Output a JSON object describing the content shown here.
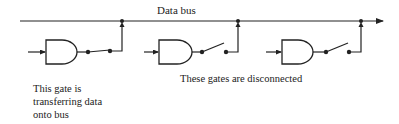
{
  "diagram": {
    "bus": {
      "label": "Data bus",
      "y": 21,
      "x_start": 20,
      "x_end": 385,
      "color": "#222222"
    },
    "gates": [
      {
        "id": "gate-1",
        "type": "AND",
        "switch_state": "closed",
        "connected": true,
        "body_x": 46,
        "body_y": 40,
        "junction_x": 122
      },
      {
        "id": "gate-2",
        "type": "AND",
        "switch_state": "open",
        "connected": false,
        "body_x": 159,
        "body_y": 40,
        "junction_x": 238
      },
      {
        "id": "gate-3",
        "type": "AND",
        "switch_state": "open",
        "connected": false,
        "body_x": 282,
        "body_y": 40,
        "junction_x": 361
      }
    ],
    "captions": {
      "connected_gate": {
        "lines": [
          "This gate is",
          "transferring data",
          "onto bus"
        ]
      },
      "disconnected_gates": "These gates are disconnected"
    }
  }
}
